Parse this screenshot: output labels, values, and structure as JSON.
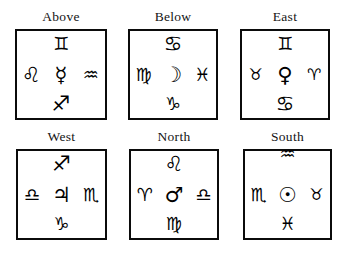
{
  "figure": {
    "type": "astrological-symbol-grid",
    "rows": 2,
    "columns": 3,
    "background_color": "#ffffff",
    "ink_color": "#0b0b0b"
  },
  "panels": [
    {
      "id": "above",
      "title": "Above",
      "symbols": {
        "top": {
          "name": "Gemini",
          "glyph": "♊"
        },
        "left": {
          "name": "Leo",
          "glyph": "♌"
        },
        "center": {
          "name": "Mercury",
          "glyph": "☿"
        },
        "right": {
          "name": "Aquarius",
          "glyph": "♒"
        },
        "bottom": {
          "name": "Sagittarius",
          "glyph": "♐"
        }
      }
    },
    {
      "id": "below",
      "title": "Below",
      "symbols": {
        "top": {
          "name": "Cancer",
          "glyph": "♋"
        },
        "left": {
          "name": "Virgo",
          "glyph": "♍"
        },
        "center": {
          "name": "Moon",
          "glyph": "☽"
        },
        "right": {
          "name": "Pisces",
          "glyph": "♓"
        },
        "bottom": {
          "name": "Capricorn",
          "glyph": "♑"
        }
      }
    },
    {
      "id": "east",
      "title": "East",
      "symbols": {
        "top": {
          "name": "Gemini",
          "glyph": "♊"
        },
        "left": {
          "name": "Taurus",
          "glyph": "♉"
        },
        "center": {
          "name": "Venus",
          "glyph": "♀"
        },
        "right": {
          "name": "Aries",
          "glyph": "♈"
        },
        "bottom": {
          "name": "Cancer",
          "glyph": "♋"
        }
      }
    },
    {
      "id": "west",
      "title": "West",
      "symbols": {
        "top": {
          "name": "Sagittarius",
          "glyph": "♐"
        },
        "left": {
          "name": "Libra",
          "glyph": "♎"
        },
        "center": {
          "name": "Jupiter",
          "glyph": "♃"
        },
        "right": {
          "name": "Scorpio",
          "glyph": "♏"
        },
        "bottom": {
          "name": "Capricorn",
          "glyph": "♑"
        }
      }
    },
    {
      "id": "north",
      "title": "North",
      "symbols": {
        "top": {
          "name": "Leo",
          "glyph": "♌"
        },
        "left": {
          "name": "Aries",
          "glyph": "♈"
        },
        "center": {
          "name": "Mars",
          "glyph": "♂"
        },
        "right": {
          "name": "Libra",
          "glyph": "♎"
        },
        "bottom": {
          "name": "Virgo",
          "glyph": "♍"
        }
      }
    },
    {
      "id": "south",
      "title": "South",
      "symbols": {
        "top": {
          "name": "Aquarius",
          "glyph": "♒"
        },
        "left": {
          "name": "Scorpio",
          "glyph": "♏"
        },
        "center": {
          "name": "Sun",
          "glyph": "☉"
        },
        "right": {
          "name": "Taurus",
          "glyph": "♉"
        },
        "bottom": {
          "name": "Pisces",
          "glyph": "♓"
        }
      }
    }
  ]
}
